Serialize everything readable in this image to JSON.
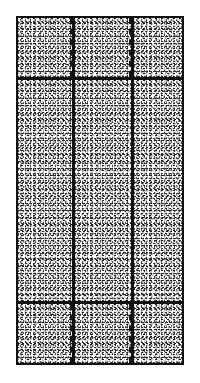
{
  "figure": {
    "style": "patent-line-drawing",
    "background_color": "#ffffff",
    "line_color": "#111111",
    "fill_pattern": "stipple",
    "canvas": {
      "width": 200,
      "height": 383
    },
    "frame": {
      "label": "outer-panel-frame",
      "x": 16,
      "y": 16,
      "width": 168,
      "height": 349,
      "border_width": 3
    },
    "grid": {
      "rows": 3,
      "columns": 3,
      "row_labels": [
        "top-row",
        "middle-row",
        "bottom-row"
      ],
      "column_labels": [
        "left-column",
        "center-column",
        "right-column"
      ],
      "row_divider_y": [
        77,
        301
      ],
      "column_divider_x": [
        72,
        131
      ],
      "divider_width": 3
    },
    "cells": [
      {
        "label": "cell-top-left",
        "row": 0,
        "col": 0,
        "x": 18,
        "y": 18,
        "width": 54,
        "height": 59,
        "fill": "stipple"
      },
      {
        "label": "cell-top-center",
        "row": 0,
        "col": 1,
        "x": 75,
        "y": 18,
        "width": 56,
        "height": 59,
        "fill": "stipple"
      },
      {
        "label": "cell-top-right",
        "row": 0,
        "col": 2,
        "x": 134,
        "y": 18,
        "width": 48,
        "height": 59,
        "fill": "stipple"
      },
      {
        "label": "cell-middle-left",
        "row": 1,
        "col": 0,
        "x": 18,
        "y": 80,
        "width": 54,
        "height": 221,
        "fill": "stipple"
      },
      {
        "label": "cell-middle-center",
        "row": 1,
        "col": 1,
        "x": 75,
        "y": 80,
        "width": 56,
        "height": 221,
        "fill": "stipple"
      },
      {
        "label": "cell-middle-right",
        "row": 1,
        "col": 2,
        "x": 134,
        "y": 80,
        "width": 48,
        "height": 221,
        "fill": "stipple"
      },
      {
        "label": "cell-bottom-left",
        "row": 2,
        "col": 0,
        "x": 18,
        "y": 304,
        "width": 54,
        "height": 59,
        "fill": "stipple"
      },
      {
        "label": "cell-bottom-center",
        "row": 2,
        "col": 1,
        "x": 75,
        "y": 304,
        "width": 56,
        "height": 59,
        "fill": "stipple"
      },
      {
        "label": "cell-bottom-right",
        "row": 2,
        "col": 2,
        "x": 134,
        "y": 304,
        "width": 48,
        "height": 59,
        "fill": "stipple"
      }
    ],
    "dashed_lines": [
      {
        "label": "dashed-line-top-left",
        "x": 70,
        "y": 18,
        "height": 59,
        "orientation": "vertical"
      },
      {
        "label": "dashed-line-top-right",
        "x": 129,
        "y": 18,
        "height": 59,
        "orientation": "vertical"
      },
      {
        "label": "dashed-line-bottom-left",
        "x": 70,
        "y": 304,
        "height": 59,
        "orientation": "vertical"
      },
      {
        "label": "dashed-line-bottom-right",
        "x": 129,
        "y": 304,
        "height": 59,
        "orientation": "vertical"
      }
    ]
  }
}
